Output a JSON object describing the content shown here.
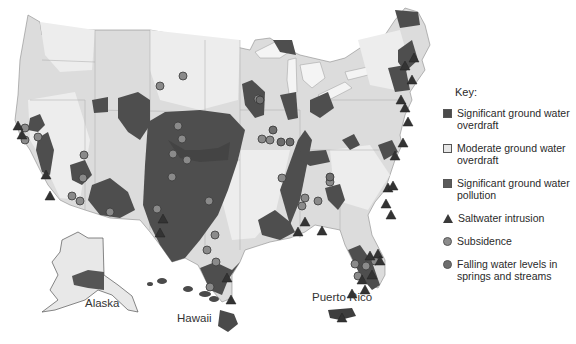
{
  "colors": {
    "ocean": "#ffffff",
    "land": "#dcdcdc",
    "moderate": "#e8e8e8",
    "overdraft": "#4a4a4a",
    "pollution": "#5a5a5a",
    "subsidence": "#8a8a8a",
    "falling": "#6e6e6e",
    "border": "#a8a8a8"
  },
  "legend": {
    "title": "Key:",
    "items": [
      {
        "id": "significant-overdraft",
        "symbol": "square",
        "color": "#4a4a4a",
        "label": "Significant ground water overdraft"
      },
      {
        "id": "moderate-overdraft",
        "symbol": "square",
        "color": "#e6e6e6",
        "label": "Moderate ground water overdraft"
      },
      {
        "id": "significant-pollution",
        "symbol": "square",
        "color": "#5a5a5a",
        "label": "Significant ground water pollution"
      },
      {
        "id": "saltwater-intrusion",
        "symbol": "triangle",
        "color": "#3a3a3a",
        "label": "Saltwater intrusion"
      },
      {
        "id": "subsidence",
        "symbol": "circle",
        "color": "#8c8c8c",
        "label": "Subsidence"
      },
      {
        "id": "falling-water",
        "symbol": "circle",
        "color": "#6e6e6e",
        "label": "Falling water levels in springs and streams"
      }
    ]
  },
  "labels": {
    "alaska": "Alaska",
    "hawaii": "Hawaii",
    "puerto_rico": "Puerto Rico"
  },
  "markers": {
    "subsidence": [
      [
        25,
        128
      ],
      [
        25,
        140
      ],
      [
        38,
        137
      ],
      [
        84,
        155
      ],
      [
        83,
        178
      ],
      [
        72,
        196
      ],
      [
        80,
        201
      ],
      [
        110,
        212
      ],
      [
        183,
        76
      ],
      [
        160,
        86
      ],
      [
        178,
        126
      ],
      [
        182,
        139
      ],
      [
        173,
        154
      ],
      [
        187,
        160
      ],
      [
        172,
        177
      ],
      [
        157,
        209
      ],
      [
        209,
        201
      ],
      [
        215,
        235
      ],
      [
        258,
        99
      ],
      [
        262,
        139
      ],
      [
        270,
        140
      ],
      [
        305,
        198
      ],
      [
        282,
        178
      ],
      [
        318,
        201
      ],
      [
        302,
        206
      ],
      [
        330,
        182
      ],
      [
        207,
        250
      ],
      [
        216,
        262
      ],
      [
        210,
        287
      ],
      [
        355,
        264
      ],
      [
        358,
        276
      ],
      [
        375,
        261
      ],
      [
        366,
        266
      ]
    ],
    "falling": [
      [
        260,
        100
      ],
      [
        273,
        130
      ],
      [
        281,
        142
      ],
      [
        290,
        142
      ],
      [
        330,
        177
      ]
    ],
    "saltwater": [
      [
        18,
        126
      ],
      [
        22,
        135
      ],
      [
        46,
        175
      ],
      [
        50,
        196
      ],
      [
        163,
        219
      ],
      [
        160,
        233
      ],
      [
        231,
        300
      ],
      [
        227,
        278
      ],
      [
        305,
        222
      ],
      [
        298,
        232
      ],
      [
        322,
        231
      ],
      [
        352,
        294
      ],
      [
        362,
        280
      ],
      [
        365,
        290
      ],
      [
        370,
        256
      ],
      [
        378,
        254
      ],
      [
        372,
        275
      ],
      [
        380,
        261
      ],
      [
        388,
        188
      ],
      [
        393,
        186
      ],
      [
        395,
        156
      ],
      [
        403,
        143
      ],
      [
        408,
        122
      ],
      [
        405,
        108
      ],
      [
        401,
        100
      ],
      [
        412,
        80
      ],
      [
        405,
        66
      ],
      [
        414,
        58
      ],
      [
        391,
        215
      ],
      [
        386,
        204
      ],
      [
        342,
        318
      ]
    ]
  }
}
